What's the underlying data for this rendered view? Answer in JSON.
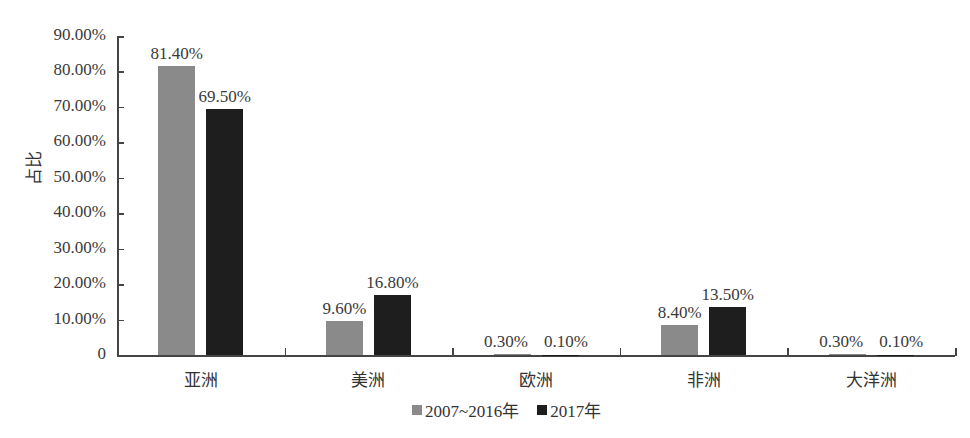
{
  "chart_data": {
    "type": "bar",
    "title": "",
    "xlabel": "",
    "ylabel": "占比",
    "ylim": [
      0,
      90
    ],
    "y_ticks": [
      "0",
      "10.00%",
      "20.00%",
      "30.00%",
      "40.00%",
      "50.00%",
      "60.00%",
      "70.00%",
      "80.00%",
      "90.00%"
    ],
    "categories": [
      "亚洲",
      "美洲",
      "欧洲",
      "非洲",
      "大洋洲"
    ],
    "series": [
      {
        "name": "2007~2016年",
        "color": "#8a8a8a",
        "values": [
          81.4,
          9.6,
          0.3,
          8.4,
          0.3
        ],
        "labels": [
          "81.40%",
          "9.60%",
          "0.30%",
          "8.40%",
          "0.30%"
        ]
      },
      {
        "name": "2017年",
        "color": "#1e1e1e",
        "values": [
          69.5,
          16.8,
          0.1,
          13.5,
          0.1
        ],
        "labels": [
          "69.50%",
          "16.80%",
          "0.10%",
          "13.50%",
          "0.10%"
        ]
      }
    ],
    "legend_position": "bottom",
    "grid": false
  }
}
